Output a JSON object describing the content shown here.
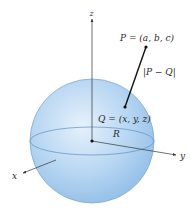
{
  "diagram": {
    "type": "sphere-distance",
    "axes": {
      "x": {
        "label": "x"
      },
      "y": {
        "label": "y"
      },
      "z": {
        "label": "z"
      }
    },
    "sphere": {
      "radius_label": "R",
      "fill_color": "#a9cdef",
      "edge_color": "#6f9fd0"
    },
    "points": {
      "P": {
        "label": "P = (a, b, c)"
      },
      "Q": {
        "label": "Q = (x, y, z)"
      }
    },
    "distance_label": "|P − Q|",
    "colors": {
      "axis": "#333333",
      "segment": "#111111",
      "text": "#2a2a2a"
    }
  }
}
